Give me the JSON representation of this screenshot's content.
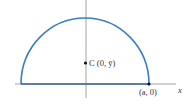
{
  "diagram": {
    "type": "semicircle-centroid",
    "colors": {
      "curve": "#3a7ec4",
      "axis": "#888888",
      "point": "#111111",
      "text": "#333333"
    },
    "labels": {
      "centroid": "C (0, ȳ)",
      "endpoint": "(a, 0)",
      "x_axis": "x"
    }
  }
}
